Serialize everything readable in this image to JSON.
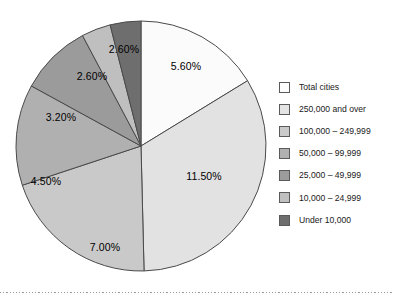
{
  "chart_data": {
    "type": "pie",
    "title": "",
    "subtitle": "",
    "xlabel": "",
    "ylabel": "",
    "grid": false,
    "legend_position": "right",
    "start_angle_deg": 0,
    "direction": "clockwise",
    "categories": [
      "Total cities",
      "250,000 and over",
      "100,000 – 249,999",
      "50,000 – 99,999",
      "25,000 – 49,999",
      "10,000 – 24,999",
      "Under 10,000"
    ],
    "values": [
      5.6,
      11.5,
      7.0,
      4.5,
      3.2,
      2.6,
      2.6
    ],
    "value_labels": [
      "5.60%",
      "11.50%",
      "7.00%",
      "4.50%",
      "3.20%",
      "2.60%",
      "2.60%"
    ],
    "colors": [
      "#fbfbfb",
      "#e2e2e2",
      "#c9c9c9",
      "#b0b0b0",
      "#9b9b9b",
      "#bfbfbf",
      "#6e6e6e"
    ],
    "slice_border_color": "#4a4a4a",
    "slices": [
      {
        "label": "Total cities",
        "value": 5.6,
        "value_label": "5.60%",
        "color": "#fbfbfb",
        "start_deg": 0,
        "sweep_deg": 58.5,
        "label_x": 178,
        "label_y": 55
      },
      {
        "label": "250,000 and over",
        "value": 11.5,
        "value_label": "11.50%",
        "color": "#e2e2e2",
        "start_deg": 58.5,
        "sweep_deg": 120.1,
        "label_x": 196,
        "label_y": 165
      },
      {
        "label": "100,000 – 249,999",
        "value": 7.0,
        "value_label": "7.00%",
        "color": "#c9c9c9",
        "start_deg": 178.6,
        "sweep_deg": 73.1,
        "label_x": 97,
        "label_y": 236
      },
      {
        "label": "50,000 – 99,999",
        "value": 4.5,
        "value_label": "4.50%",
        "color": "#b0b0b0",
        "start_deg": 251.7,
        "sweep_deg": 47.0,
        "label_x": 38,
        "label_y": 170
      },
      {
        "label": "25,000 – 49,999",
        "value": 3.2,
        "value_label": "3.20%",
        "color": "#9b9b9b",
        "start_deg": 298.7,
        "sweep_deg": 33.4,
        "label_x": 53,
        "label_y": 106
      },
      {
        "label": "10,000 – 24,999",
        "value": 2.6,
        "value_label": "2.60%",
        "color": "#bfbfbf",
        "start_deg": 332.1,
        "sweep_deg": 13.6,
        "label_x": 84,
        "label_y": 65
      },
      {
        "label": "Under 10,000",
        "value": 2.6,
        "value_label": "2.60%",
        "color": "#6e6e6e",
        "start_deg": 345.7,
        "sweep_deg": 14.3,
        "label_x": 116,
        "label_y": 38
      }
    ],
    "geometry": {
      "center_x": 133,
      "center_y": 134,
      "radius": 125
    }
  },
  "legend": {
    "items": [
      {
        "label": "Total cities",
        "color": "#fdfdfd"
      },
      {
        "label": "250,000 and over",
        "color": "#e4e4e4"
      },
      {
        "label": "100,000 – 249,999",
        "color": "#cacaca"
      },
      {
        "label": "50,000 – 99,999",
        "color": "#b1b1b1"
      },
      {
        "label": "25,000 – 49,999",
        "color": "#9c9c9c"
      },
      {
        "label": "10,000 – 24,999",
        "color": "#c0c0c0"
      },
      {
        "label": "Under 10,000",
        "color": "#6e6e6e"
      }
    ]
  }
}
